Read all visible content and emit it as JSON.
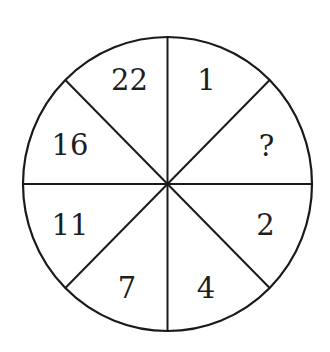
{
  "puzzle": {
    "type": "number-wheel",
    "segments": 8,
    "colors": {
      "background": "#ffffff",
      "line": "#1a1a1a",
      "text": "#1e1e1e"
    },
    "sectors": [
      {
        "position": "top-left",
        "value": "22"
      },
      {
        "position": "top-right",
        "value": "1"
      },
      {
        "position": "right-upper",
        "value": "?"
      },
      {
        "position": "right-lower",
        "value": "2"
      },
      {
        "position": "bottom-right",
        "value": "4"
      },
      {
        "position": "bottom-left",
        "value": "7"
      },
      {
        "position": "left-lower",
        "value": "11"
      },
      {
        "position": "left-upper",
        "value": "16"
      }
    ]
  }
}
